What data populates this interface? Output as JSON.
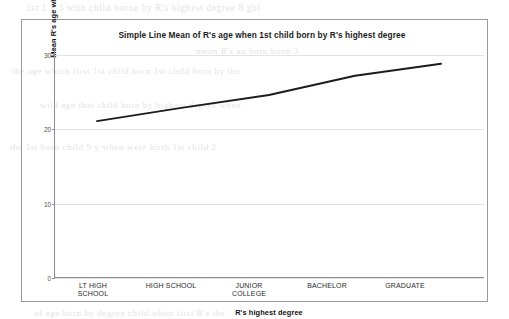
{
  "chart_data": {
    "type": "line",
    "title": "Simple Line Mean of R's age when 1st child born by R's highest degree",
    "xlabel": "R's highest degree",
    "ylabel": "Mean R's age when 1st child born",
    "categories": [
      "LT HIGH SCHOOL",
      "HIGH SCHOOL",
      "JUNIOR COLLEGE",
      "BACHELOR",
      "GRADUATE"
    ],
    "category_lines": [
      [
        "LT HIGH",
        "SCHOOL"
      ],
      [
        "HIGH SCHOOL"
      ],
      [
        "JUNIOR",
        "COLLEGE"
      ],
      [
        "BACHELOR"
      ],
      [
        "GRADUATE"
      ]
    ],
    "values": [
      21.1,
      22.9,
      24.6,
      27.2,
      28.8
    ],
    "ylim": [
      0,
      32
    ],
    "yticks": [
      0,
      10,
      20,
      30
    ],
    "ytick_labels": [
      "0",
      "10",
      "20",
      "30"
    ],
    "grid": "horizontal",
    "legend": "none",
    "line_color": "#1c1c1c",
    "grid_color": "#e2e2e6",
    "axis_color": "#8d8d8d",
    "line_width": 1.9
  },
  "figure": {
    "border_color": "#9a9a9a",
    "background": "#ffffff"
  },
  "scan_artifacts": {
    "ghost_text": [
      "1st 1 2 3 with child borne by R's highest degree  8 gbi",
      "mean R's  ag  born    bonn  3",
      "the age which first 1st child born 1st child born by the",
      "wild age  that  child born by highest degree  when",
      "the  1st  born child  9 y  when  were  birth  1st  child  2",
      "of  age  born  by  degree  child  when  first  R's  the"
    ]
  }
}
